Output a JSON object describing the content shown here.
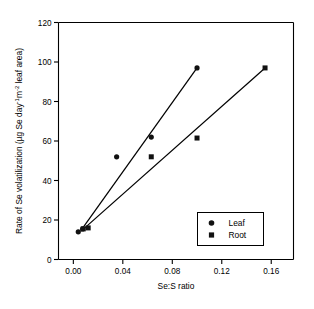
{
  "figure": {
    "background": "#ffffff",
    "ink_color": "#000000",
    "marker_color": "#111111"
  },
  "chart_data": {
    "type": "scatter",
    "title": "",
    "subtitle": "",
    "xlabel": "Se:S ratio",
    "ylabel": "Rate of Se volatilization (µg Se day⁻¹m⁻² leaf area)",
    "ylabel_parts": {
      "lead": "Rate of Se volatilization (µg Se day",
      "sup1": "-1",
      "mid": "m",
      "sup2": "-2",
      "tail": " leaf area)"
    },
    "xlim": [
      -0.012,
      0.178
    ],
    "ylim": [
      0,
      120
    ],
    "xticks": [
      0.0,
      0.04,
      0.08,
      0.12,
      0.16
    ],
    "xticklabels": [
      "0.00",
      "0.04",
      "0.08",
      "0.12",
      "0.16"
    ],
    "yticks": [
      0,
      20,
      40,
      60,
      80,
      100,
      120
    ],
    "yticklabels": [
      "0",
      "20",
      "40",
      "60",
      "80",
      "100",
      "120"
    ],
    "grid": false,
    "legend_position": "lower-right",
    "series": [
      {
        "name": "Leaf",
        "marker": "circle",
        "marker_size": 5.2,
        "color": "#111111",
        "x": [
          0.004,
          0.0075,
          0.035,
          0.063,
          0.1
        ],
        "y": [
          14.0,
          15.5,
          52.0,
          62.0,
          97.0
        ],
        "fit_line": {
          "x": [
            0.0065,
            0.1
          ],
          "y": [
            15.0,
            97.0
          ]
        }
      },
      {
        "name": "Root",
        "marker": "square",
        "marker_size": 5.0,
        "color": "#111111",
        "x": [
          0.008,
          0.012,
          0.063,
          0.1,
          0.155
        ],
        "y": [
          15.5,
          16.0,
          52.0,
          61.5,
          97.0
        ],
        "fit_line": {
          "x": [
            0.0065,
            0.155
          ],
          "y": [
            14.5,
            97.0
          ]
        }
      }
    ],
    "legend_entries": [
      {
        "label": "Leaf",
        "marker": "circle"
      },
      {
        "label": "Root",
        "marker": "square"
      }
    ]
  }
}
